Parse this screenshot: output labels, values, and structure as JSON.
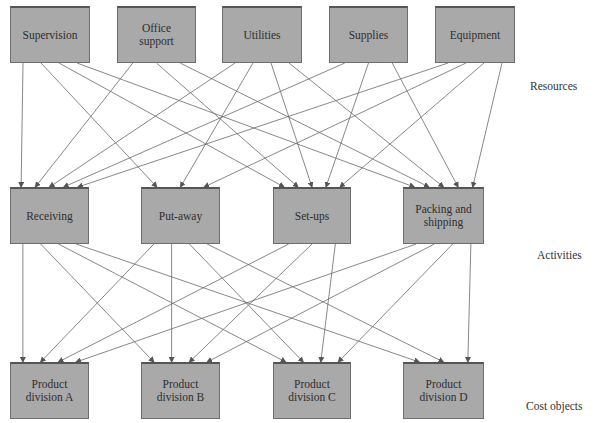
{
  "levels": {
    "resources": "Resources",
    "activities": "Activities",
    "cost_objects": "Cost objects"
  },
  "resources": [
    {
      "id": "supervision",
      "label": "Supervision",
      "x": 10,
      "y": 6,
      "w": 80,
      "h": 57
    },
    {
      "id": "office-support",
      "label": "Office support",
      "x": 117,
      "y": 6,
      "w": 79,
      "h": 57
    },
    {
      "id": "utilities",
      "label": "Utilities",
      "x": 222,
      "y": 6,
      "w": 80,
      "h": 57
    },
    {
      "id": "supplies",
      "label": "Supplies",
      "x": 329,
      "y": 6,
      "w": 79,
      "h": 57
    },
    {
      "id": "equipment",
      "label": "Equipment",
      "x": 435,
      "y": 6,
      "w": 80,
      "h": 57
    }
  ],
  "activities": [
    {
      "id": "receiving",
      "label": "Receiving",
      "x": 10,
      "y": 187,
      "w": 79,
      "h": 57
    },
    {
      "id": "put-away",
      "label": "Put-away",
      "x": 141,
      "y": 187,
      "w": 79,
      "h": 57
    },
    {
      "id": "set-ups",
      "label": "Set-ups",
      "x": 273,
      "y": 187,
      "w": 78,
      "h": 57
    },
    {
      "id": "packing-shipping",
      "label": "Packing and shipping",
      "x": 403,
      "y": 187,
      "w": 81,
      "h": 57
    }
  ],
  "cost_objects": [
    {
      "id": "division-a",
      "label": "Product division A",
      "x": 10,
      "y": 362,
      "w": 79,
      "h": 57
    },
    {
      "id": "division-b",
      "label": "Product division B",
      "x": 141,
      "y": 362,
      "w": 79,
      "h": 57
    },
    {
      "id": "division-c",
      "label": "Product division C",
      "x": 273,
      "y": 362,
      "w": 78,
      "h": 57
    },
    {
      "id": "division-d",
      "label": "Product division D",
      "x": 403,
      "y": 362,
      "w": 81,
      "h": 57
    }
  ],
  "edges_resources_to_activities": [
    [
      "supervision",
      "receiving"
    ],
    [
      "supervision",
      "put-away"
    ],
    [
      "supervision",
      "set-ups"
    ],
    [
      "supervision",
      "packing-shipping"
    ],
    [
      "office-support",
      "receiving"
    ],
    [
      "office-support",
      "set-ups"
    ],
    [
      "office-support",
      "packing-shipping"
    ],
    [
      "utilities",
      "receiving"
    ],
    [
      "utilities",
      "put-away"
    ],
    [
      "utilities",
      "set-ups"
    ],
    [
      "utilities",
      "packing-shipping"
    ],
    [
      "supplies",
      "receiving"
    ],
    [
      "supplies",
      "set-ups"
    ],
    [
      "supplies",
      "packing-shipping"
    ],
    [
      "equipment",
      "receiving"
    ],
    [
      "equipment",
      "put-away"
    ],
    [
      "equipment",
      "set-ups"
    ],
    [
      "equipment",
      "packing-shipping"
    ]
  ],
  "edges_activities_to_cost_objects": [
    [
      "receiving",
      "division-a"
    ],
    [
      "receiving",
      "division-b"
    ],
    [
      "receiving",
      "division-c"
    ],
    [
      "receiving",
      "division-d"
    ],
    [
      "put-away",
      "division-a"
    ],
    [
      "put-away",
      "division-b"
    ],
    [
      "put-away",
      "division-c"
    ],
    [
      "put-away",
      "division-d"
    ],
    [
      "set-ups",
      "division-a"
    ],
    [
      "set-ups",
      "division-b"
    ],
    [
      "set-ups",
      "division-c"
    ],
    [
      "packing-shipping",
      "division-a"
    ],
    [
      "packing-shipping",
      "division-b"
    ],
    [
      "packing-shipping",
      "division-c"
    ],
    [
      "packing-shipping",
      "division-d"
    ]
  ],
  "colors": {
    "box_fill": "#a9a9a9",
    "box_border": "#6e6e6e",
    "line": "#555555"
  }
}
